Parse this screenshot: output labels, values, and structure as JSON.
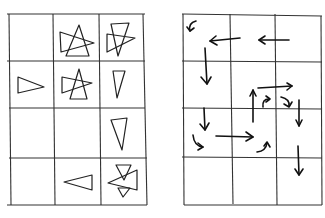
{
  "diagram": {
    "left_grid": {
      "name": "triangle-grid",
      "columns": 3,
      "rows": 4,
      "cells": [
        {
          "row": 0,
          "col": 0,
          "content": "empty"
        },
        {
          "row": 0,
          "col": 1,
          "content": "overlapping triangles"
        },
        {
          "row": 0,
          "col": 2,
          "content": "overlapping triangles"
        },
        {
          "row": 1,
          "col": 0,
          "content": "triangle pointing right"
        },
        {
          "row": 1,
          "col": 1,
          "content": "overlapping triangles"
        },
        {
          "row": 1,
          "col": 2,
          "content": "triangle pointing down"
        },
        {
          "row": 2,
          "col": 0,
          "content": "empty"
        },
        {
          "row": 2,
          "col": 1,
          "content": "empty"
        },
        {
          "row": 2,
          "col": 2,
          "content": "triangle pointing down"
        },
        {
          "row": 3,
          "col": 0,
          "content": "empty"
        },
        {
          "row": 3,
          "col": 1,
          "content": "triangle pointing left"
        },
        {
          "row": 3,
          "col": 2,
          "content": "overlapping triangles"
        }
      ]
    },
    "right_grid": {
      "name": "arrow-grid",
      "columns": 3,
      "rows": 4,
      "arrows": [
        {
          "from": "r0c0",
          "type": "curved",
          "direction": "down-left"
        },
        {
          "from": "r0c1",
          "type": "straight",
          "direction": "left"
        },
        {
          "from": "r0c2",
          "type": "straight",
          "direction": "left"
        },
        {
          "from": "r0c0-r1c0",
          "type": "straight",
          "direction": "down"
        },
        {
          "from": "r1c1-r1c2",
          "type": "straight",
          "direction": "right"
        },
        {
          "from": "r1c1-r2c1",
          "type": "straight",
          "direction": "up"
        },
        {
          "from": "r1c2",
          "type": "curved",
          "direction": "up-right"
        },
        {
          "from": "r1c2",
          "type": "curved",
          "direction": "down-right"
        },
        {
          "from": "r1c2-r2c2",
          "type": "straight",
          "direction": "down"
        },
        {
          "from": "r2c0",
          "type": "straight",
          "direction": "down"
        },
        {
          "from": "r2c0",
          "type": "curved",
          "direction": "right"
        },
        {
          "from": "r2c0-r2c1",
          "type": "straight",
          "direction": "right"
        },
        {
          "from": "r2c1",
          "type": "curved",
          "direction": "up"
        },
        {
          "from": "r2c2-r3c2",
          "type": "straight",
          "direction": "down"
        }
      ]
    }
  }
}
